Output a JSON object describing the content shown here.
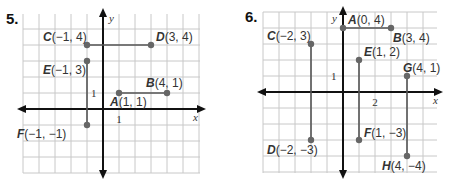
{
  "problems": [
    {
      "number": "5.",
      "axis_labels": {
        "x": "x",
        "y": "y"
      },
      "tick_labels": {
        "x": "1",
        "y": "1"
      },
      "points": [
        {
          "name": "A",
          "coords": "(1, 1)",
          "x": 1,
          "y": 1
        },
        {
          "name": "B",
          "coords": "(4, 1)",
          "x": 4,
          "y": 1
        },
        {
          "name": "C",
          "coords": "(−1, 4)",
          "x": -1,
          "y": 4
        },
        {
          "name": "D",
          "coords": "(3, 4)",
          "x": 3,
          "y": 4
        },
        {
          "name": "E",
          "coords": "(−1, 3)",
          "x": -1,
          "y": 3
        },
        {
          "name": "F",
          "coords": "(−1, −1)",
          "x": -1,
          "y": -1
        }
      ],
      "segments": [
        [
          "A",
          "B"
        ],
        [
          "C",
          "D"
        ],
        [
          "E",
          "F"
        ]
      ]
    },
    {
      "number": "6.",
      "axis_labels": {
        "x": "x",
        "y": "y"
      },
      "tick_labels": {
        "x": "2",
        "y": "1"
      },
      "points": [
        {
          "name": "A",
          "coords": "(0, 4)",
          "x": 0,
          "y": 4
        },
        {
          "name": "B",
          "coords": "(3, 4)",
          "x": 3,
          "y": 4
        },
        {
          "name": "C",
          "coords": "(−2, 3)",
          "x": -2,
          "y": 3
        },
        {
          "name": "D",
          "coords": "(−2, −3)",
          "x": -2,
          "y": -3
        },
        {
          "name": "E",
          "coords": "(1, 2)",
          "x": 1,
          "y": 2
        },
        {
          "name": "F",
          "coords": "(1, −3)",
          "x": 1,
          "y": -3
        },
        {
          "name": "G",
          "coords": "(4, 1)",
          "x": 4,
          "y": 1
        },
        {
          "name": "H",
          "coords": "(4, −4)",
          "x": 4,
          "y": -4
        }
      ],
      "segments": [
        [
          "A",
          "B"
        ],
        [
          "C",
          "D"
        ],
        [
          "E",
          "F"
        ],
        [
          "G",
          "H"
        ]
      ]
    }
  ],
  "colors": {
    "grid": "#c8c8c8",
    "axis": "#111111",
    "segment": "#555555",
    "point": "#666666"
  }
}
